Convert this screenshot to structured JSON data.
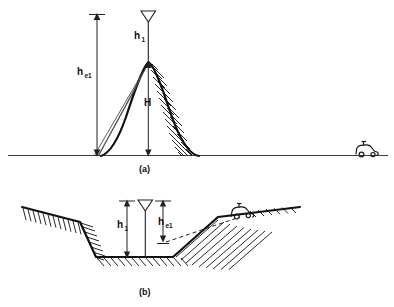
{
  "figure": {
    "panels": [
      {
        "id": "a",
        "caption": "(a)",
        "description": "Transmitting antenna on a hilltop with effective height measured from the average terrain slope",
        "labels": {
          "antenna_height": "h",
          "antenna_height_sub": "1",
          "effective_height": "h",
          "effective_height_sub": "e1",
          "hill_height": "H"
        }
      },
      {
        "id": "b",
        "caption": "(b)",
        "description": "Transmitting antenna in a valley with effective height referenced to the mobile receiver terrain",
        "labels": {
          "antenna_height": "h",
          "antenna_height_sub": "1",
          "effective_height": "h",
          "effective_height_sub": "e1"
        }
      }
    ],
    "icons": {
      "antenna": "antenna-dipole-icon",
      "vehicle": "mobile-receiver-car-icon",
      "ground": "ground-reference-line",
      "hatching": "terrain-hatch-fill"
    },
    "colors": {
      "ink": "#111111",
      "ground": "#3c3c3c",
      "tangent": "#4a4a4a",
      "background": "#ffffff"
    }
  }
}
